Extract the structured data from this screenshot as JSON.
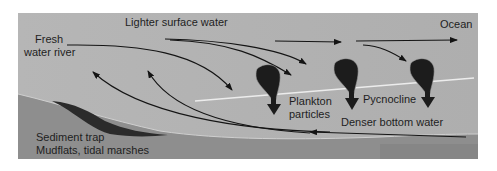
{
  "figure": {
    "colors": {
      "water": "#b4b4b4",
      "seabed": "#8c8c8c",
      "sediment": "#2a2a2a",
      "pycnocline": "#e6e6e6",
      "plankton": "#1c1c1c",
      "arrow": "#141414",
      "text": "#1e1e1e"
    },
    "labels": {
      "surface": "Lighter surface water",
      "river_line1": "Fresh",
      "river_line2": "water river",
      "ocean": "Ocean",
      "plankton_line1": "Plankton",
      "plankton_line2": "particles",
      "pycnocline": "Pycnocline",
      "bottom": "Denser bottom water",
      "sediment_line1": "Sediment trap",
      "sediment_line2": "Mudflats, tidal marshes"
    }
  }
}
